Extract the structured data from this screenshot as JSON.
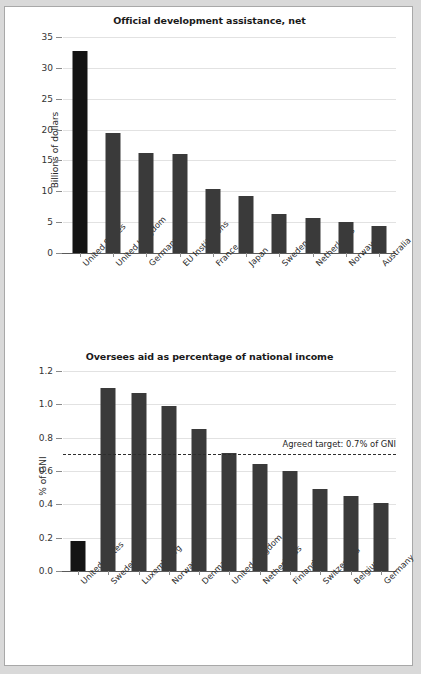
{
  "page": {
    "background": "#d9d9d9",
    "sheet_color": "#ffffff",
    "border_color": "#a8a8a8"
  },
  "chart_data": [
    {
      "id": "official-development-assistance",
      "type": "bar",
      "title": "Official development assistance, net",
      "xlabel": "",
      "ylabel": "Billions of dollars",
      "ylim": [
        0,
        35
      ],
      "yticks": [
        0,
        5,
        10,
        15,
        20,
        25,
        30,
        35
      ],
      "ytick_labels": [
        "0",
        "5",
        "10",
        "15",
        "20",
        "25",
        "30",
        "35"
      ],
      "grid": true,
      "legend": "none",
      "bar_color": "#3a3a3a",
      "highlight_color": "#141414",
      "highlight_index": 0,
      "categories": [
        "United States",
        "United Kingdom",
        "Germany",
        "EU Institutions",
        "France",
        "Japan",
        "Sweden",
        "Netherlands",
        "Norway",
        "Australia"
      ],
      "values": [
        32.8,
        19.4,
        16.2,
        16.0,
        10.4,
        9.3,
        6.3,
        5.7,
        5.1,
        4.4
      ]
    },
    {
      "id": "aid-as-percentage-of-gni",
      "type": "bar",
      "title": "Oversees aid as percentage of national income",
      "xlabel": "",
      "ylabel": "% of GNI",
      "ylim": [
        0,
        1.2
      ],
      "yticks": [
        0,
        0.2,
        0.4,
        0.6,
        0.8,
        1.0,
        1.2
      ],
      "ytick_labels": [
        "0.0",
        "0.2",
        "0.4",
        "0.6",
        "0.8",
        "1.0",
        "1.2"
      ],
      "grid": true,
      "legend": "none",
      "bar_color": "#3a3a3a",
      "highlight_color": "#141414",
      "highlight_index": 0,
      "categories": [
        "United States",
        "Sweden",
        "Luxembourg",
        "Norway",
        "Denmark",
        "United Kingdom",
        "Netherlands",
        "Finland",
        "Switzerland",
        "Belgium",
        "Germany"
      ],
      "values": [
        0.18,
        1.1,
        1.07,
        0.99,
        0.85,
        0.71,
        0.64,
        0.6,
        0.49,
        0.45,
        0.41
      ],
      "annotations": [
        {
          "type": "hline",
          "value": 0.7,
          "label": "Agreed target: 0.7% of GNI",
          "style": "dashed",
          "color": "#2e2e2e"
        }
      ]
    }
  ]
}
